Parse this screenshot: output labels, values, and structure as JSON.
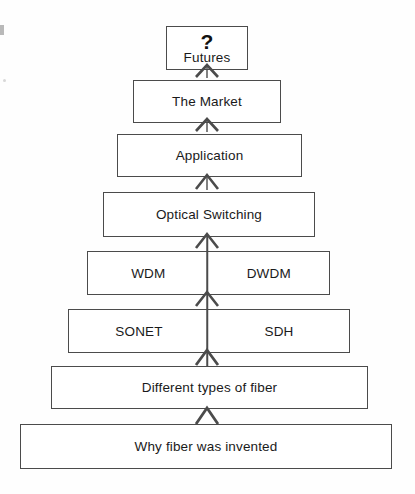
{
  "diagram": {
    "type": "stacked-pyramid-flow",
    "direction": "bottom-to-top",
    "connector_icon": "chevron-up-icon",
    "colors": {
      "background": "#fefefe",
      "box_border": "#4b4b4b",
      "box_fill": "#ffffff",
      "text": "#1a1a1a",
      "connector": "#4b4b4b"
    },
    "levels": [
      {
        "id": "futures",
        "badge": "?",
        "label": "Futures",
        "split": false,
        "x": 166,
        "y": 26,
        "width": 82,
        "height": 44
      },
      {
        "id": "the-market",
        "label": "The Market",
        "split": false,
        "x": 133,
        "y": 80,
        "width": 148,
        "height": 43
      },
      {
        "id": "application",
        "label": "Application",
        "split": false,
        "x": 117,
        "y": 134,
        "width": 185,
        "height": 43
      },
      {
        "id": "optical-switching",
        "label": "Optical Switching",
        "split": false,
        "x": 103,
        "y": 192,
        "width": 212,
        "height": 45
      },
      {
        "id": "wdm-dwdm",
        "split": true,
        "left_label": "WDM",
        "right_label": "DWDM",
        "x": 87,
        "y": 251,
        "width": 243,
        "height": 44
      },
      {
        "id": "sonet-sdh",
        "split": true,
        "left_label": "SONET",
        "right_label": "SDH",
        "x": 68,
        "y": 309,
        "width": 282,
        "height": 44
      },
      {
        "id": "different-types-of-fiber",
        "label": "Different types of fiber",
        "split": false,
        "x": 51,
        "y": 366,
        "width": 317,
        "height": 43
      },
      {
        "id": "why-fiber-was-invented",
        "label": "Why fiber was invented",
        "split": false,
        "x": 20,
        "y": 424,
        "width": 372,
        "height": 45
      }
    ],
    "connectors": [
      {
        "id": "conn-market-to-futures",
        "from": "the-market",
        "to": "futures",
        "cx": 207,
        "y": 62
      },
      {
        "id": "conn-application-to-market",
        "from": "application",
        "to": "the-market",
        "cx": 207,
        "y": 116
      },
      {
        "id": "conn-switching-to-application",
        "from": "optical-switching",
        "to": "application",
        "cx": 207,
        "y": 173
      },
      {
        "id": "conn-wdm-to-switching",
        "from": "wdm-dwdm",
        "to": "optical-switching",
        "cx": 207,
        "y": 232
      },
      {
        "id": "conn-sonet-to-wdm",
        "from": "sonet-sdh",
        "to": "wdm-dwdm",
        "cx": 207,
        "y": 290
      },
      {
        "id": "conn-fiber-to-sonet",
        "from": "different-types-of-fiber",
        "to": "sonet-sdh",
        "cx": 207,
        "y": 348
      },
      {
        "id": "conn-why-to-fiber",
        "from": "why-fiber-was-invented",
        "to": "different-types-of-fiber",
        "cx": 207,
        "y": 404
      },
      {
        "id": "conn-base-to-why",
        "from": "base",
        "to": "why-fiber-was-invented",
        "cx": 207,
        "y": 420
      }
    ]
  }
}
